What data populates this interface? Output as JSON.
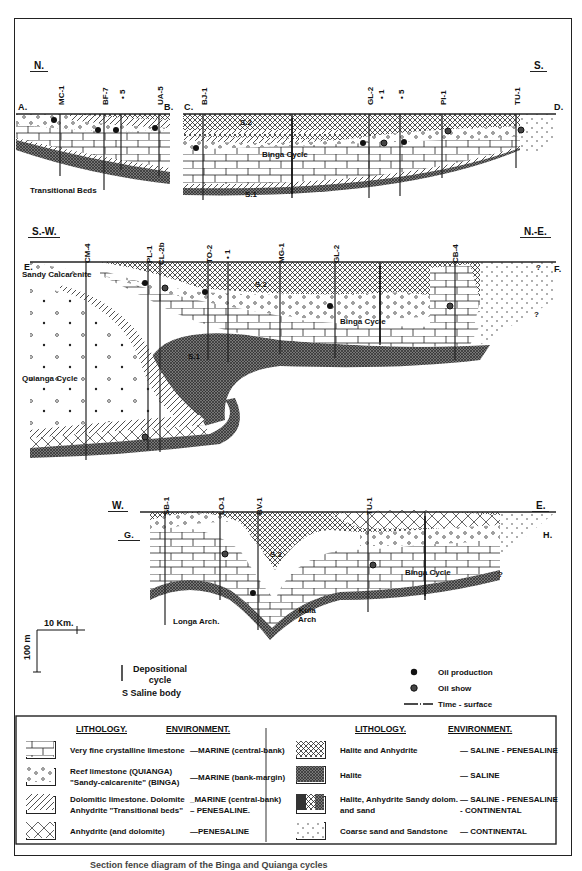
{
  "figure": {
    "caption": "Section fence diagram of the Binga and Quianga cycles"
  },
  "sections": [
    {
      "id": "A-B-C-D",
      "dir_left": "N.",
      "dir_right": "S.",
      "points": {
        "a": "A.",
        "b": "B.",
        "c": "C.",
        "d": "D."
      },
      "wells": [
        "MC-1",
        "BF-7",
        "• 5",
        "UA-5",
        "BJ-1",
        "GL-2",
        "• 1",
        "• 5",
        "PI-1",
        "TU-1"
      ],
      "annotations": {
        "s2": "S.2",
        "s1": "S.1",
        "cycle": "Binga Cycle",
        "transitional": "Transitional Beds"
      }
    },
    {
      "id": "E-F",
      "dir_left": "S.-W.",
      "dir_right": "N.-E.",
      "points": {
        "e": "E.",
        "f": "F."
      },
      "wells": [
        "CM-4",
        "PL-1",
        "CL-2b",
        "TO-2",
        "• 1",
        "MG-1",
        "GL-2",
        "CB-4"
      ],
      "annotations": {
        "sandy": "Sandy Calcarenite",
        "s2": "S.2",
        "s1": "S.1",
        "binga": "Binga Cycle",
        "quianga": "Quianga Cycle",
        "q1": "?",
        "q2": "?"
      }
    },
    {
      "id": "G-H",
      "dir_left": "W.",
      "dir_right": "E.",
      "points": {
        "g": "G.",
        "h": "H."
      },
      "wells": [
        "SB-1",
        "LO-1",
        "BV-1",
        "TU-1"
      ],
      "annotations": {
        "s2": "S.2",
        "binga": "Binga Cycle",
        "longa": "Longa Arch.",
        "kula": "Kula\nArch",
        "q": "?"
      }
    }
  ],
  "scale": {
    "horizontal": "10 Km.",
    "vertical": "100 m"
  },
  "key": {
    "depositional": "Depositional cycle",
    "saline": "S  Saline body",
    "oil_production": "Oil production",
    "oil_show": "Oil show",
    "time_surface": "Time - surface"
  },
  "legend": {
    "headers": {
      "lithology": "LITHOLOGY.",
      "environment": "ENVIRONMENT."
    },
    "left": [
      {
        "pattern": "limestone",
        "lithology": "Very fine crystalline limestone",
        "environment": "—MARINE (central-bank)"
      },
      {
        "pattern": "reef",
        "lithology": "Reef limestone (QUIANGA) \"Sandy-calcarenite\" (BINGA)",
        "environment": "—MARINE (bank-margin)"
      },
      {
        "pattern": "dolomite",
        "lithology": "Dolomitic limestone. Dolomite Anhydrite \"Transitional beds\"",
        "environment": "_MARINE (central-bank)\n– PENESALINE."
      },
      {
        "pattern": "anhydrite",
        "lithology": "Anhydrite (and dolomite)",
        "environment": "—PENESALINE"
      }
    ],
    "right": [
      {
        "pattern": "halite-anhydrite",
        "lithology": "Halite and Anhydrite",
        "environment": "— SALINE - PENESALINE"
      },
      {
        "pattern": "halite",
        "lithology": "Halite",
        "environment": "— SALINE"
      },
      {
        "pattern": "mixed",
        "lithology": "Halite, Anhydrite Sandy dolom. and sand",
        "environment": "— SALINE - PENESALINE\n- CONTINENTAL"
      },
      {
        "pattern": "sand",
        "lithology": "Coarse sand and Sandstone",
        "environment": "— CONTINENTAL"
      }
    ]
  },
  "colors": {
    "ink": "#1a1a1a",
    "paper": "#ffffff"
  }
}
